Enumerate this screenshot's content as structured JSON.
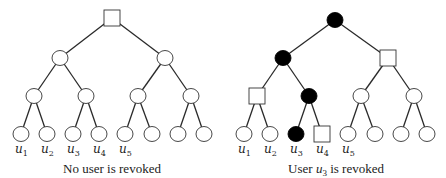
{
  "trees": [
    {
      "name": "left-tree",
      "offset_x": 0,
      "caption": "No user is revoked",
      "caption_parts": [
        {
          "text": "No user is revoked",
          "italic": false
        }
      ],
      "nodes": [
        {
          "id": "root",
          "x": 112,
          "y": 18,
          "shape": "square",
          "fill": "open"
        },
        {
          "id": "n1",
          "x": 60,
          "y": 58,
          "shape": "circle",
          "fill": "open"
        },
        {
          "id": "n2",
          "x": 165,
          "y": 58,
          "shape": "circle",
          "fill": "open"
        },
        {
          "id": "n3",
          "x": 34,
          "y": 96,
          "shape": "circle",
          "fill": "open"
        },
        {
          "id": "n4",
          "x": 86,
          "y": 96,
          "shape": "circle",
          "fill": "open"
        },
        {
          "id": "n5",
          "x": 138,
          "y": 96,
          "shape": "circle",
          "fill": "open"
        },
        {
          "id": "n6",
          "x": 191,
          "y": 96,
          "shape": "circle",
          "fill": "open"
        },
        {
          "id": "l1",
          "x": 21,
          "y": 134,
          "shape": "circle",
          "fill": "open",
          "label": "u",
          "sub": "1"
        },
        {
          "id": "l2",
          "x": 47,
          "y": 134,
          "shape": "circle",
          "fill": "open",
          "label": "u",
          "sub": "2"
        },
        {
          "id": "l3",
          "x": 73,
          "y": 134,
          "shape": "circle",
          "fill": "open",
          "label": "u",
          "sub": "3"
        },
        {
          "id": "l4",
          "x": 99,
          "y": 134,
          "shape": "circle",
          "fill": "open",
          "label": "u",
          "sub": "4"
        },
        {
          "id": "l5",
          "x": 125,
          "y": 134,
          "shape": "circle",
          "fill": "open",
          "label": "u",
          "sub": "5"
        },
        {
          "id": "l6",
          "x": 152,
          "y": 134,
          "shape": "circle",
          "fill": "open"
        },
        {
          "id": "l7",
          "x": 178,
          "y": 134,
          "shape": "circle",
          "fill": "open"
        },
        {
          "id": "l8",
          "x": 204,
          "y": 134,
          "shape": "circle",
          "fill": "open"
        }
      ]
    },
    {
      "name": "right-tree",
      "offset_x": 223,
      "caption": "User u3 is revoked",
      "nodes": [
        {
          "id": "root",
          "x": 112,
          "y": 20,
          "shape": "circle",
          "fill": "filled"
        },
        {
          "id": "n1",
          "x": 60,
          "y": 58,
          "shape": "circle",
          "fill": "filled"
        },
        {
          "id": "n2",
          "x": 165,
          "y": 58,
          "shape": "square",
          "fill": "open"
        },
        {
          "id": "n3",
          "x": 34,
          "y": 96,
          "shape": "square",
          "fill": "open"
        },
        {
          "id": "n4",
          "x": 86,
          "y": 96,
          "shape": "circle",
          "fill": "filled"
        },
        {
          "id": "n5",
          "x": 138,
          "y": 96,
          "shape": "circle",
          "fill": "open"
        },
        {
          "id": "n6",
          "x": 191,
          "y": 96,
          "shape": "circle",
          "fill": "open"
        },
        {
          "id": "l1",
          "x": 21,
          "y": 134,
          "shape": "circle",
          "fill": "open",
          "label": "u",
          "sub": "1"
        },
        {
          "id": "l2",
          "x": 47,
          "y": 134,
          "shape": "circle",
          "fill": "open",
          "label": "u",
          "sub": "2"
        },
        {
          "id": "l3",
          "x": 73,
          "y": 134,
          "shape": "circle",
          "fill": "filled",
          "label": "u",
          "sub": "3"
        },
        {
          "id": "l4",
          "x": 99,
          "y": 134,
          "shape": "square",
          "fill": "open",
          "label": "u",
          "sub": "4"
        },
        {
          "id": "l5",
          "x": 125,
          "y": 134,
          "shape": "circle",
          "fill": "open",
          "label": "u",
          "sub": "5"
        },
        {
          "id": "l6",
          "x": 152,
          "y": 134,
          "shape": "circle",
          "fill": "open"
        },
        {
          "id": "l7",
          "x": 178,
          "y": 134,
          "shape": "circle",
          "fill": "open"
        },
        {
          "id": "l8",
          "x": 204,
          "y": 134,
          "shape": "circle",
          "fill": "open"
        }
      ]
    }
  ],
  "edges": [
    [
      "root",
      "n1"
    ],
    [
      "root",
      "n2"
    ],
    [
      "n1",
      "n3"
    ],
    [
      "n1",
      "n4"
    ],
    [
      "n2",
      "n5"
    ],
    [
      "n2",
      "n6"
    ],
    [
      "n3",
      "l1"
    ],
    [
      "n3",
      "l2"
    ],
    [
      "n4",
      "l3"
    ],
    [
      "n4",
      "l4"
    ],
    [
      "n5",
      "l5"
    ],
    [
      "n5",
      "l6"
    ],
    [
      "n6",
      "l7"
    ],
    [
      "n6",
      "l8"
    ]
  ],
  "captions": {
    "left": "No user is revoked",
    "right_prefix": "User ",
    "right_var": "u",
    "right_sub": "3",
    "right_suffix": " is revoked"
  },
  "colors": {
    "filled": "#000000",
    "open": "#ffffff",
    "stroke": "#333333"
  }
}
